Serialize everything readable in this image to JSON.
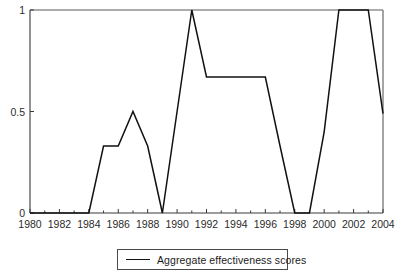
{
  "chart_data": {
    "type": "line",
    "title": "",
    "xlabel": "",
    "ylabel": "",
    "xlim": [
      1980,
      2004
    ],
    "ylim": [
      0,
      1
    ],
    "grid": false,
    "legend_position": "bottom-center",
    "x": [
      1980,
      1981,
      1982,
      1983,
      1984,
      1985,
      1986,
      1987,
      1988,
      1989,
      1990,
      1991,
      1992,
      1993,
      1994,
      1995,
      1996,
      1997,
      1998,
      1999,
      2000,
      2001,
      2002,
      2003,
      2004
    ],
    "series": [
      {
        "name": "Aggregate effectiveness scores",
        "color": "#111111",
        "values": [
          0,
          0,
          0,
          0,
          0,
          0.33,
          0.33,
          0.5,
          0.33,
          0,
          0.5,
          1,
          0.67,
          0.67,
          0.67,
          0.67,
          0.67,
          0.33,
          0,
          0,
          0.4,
          1,
          1,
          1,
          0.49
        ]
      }
    ],
    "xticks": [
      1980,
      1982,
      1984,
      1986,
      1988,
      1990,
      1992,
      1994,
      1996,
      1998,
      2000,
      2002,
      2004
    ],
    "xtick_labels": [
      "1980",
      "1982",
      "1984",
      "1986",
      "1988",
      "1990",
      "1992",
      "1994",
      "1996",
      "1998",
      "2000",
      "2002",
      "2004"
    ],
    "xticks_minor": [
      1981,
      1983,
      1985,
      1987,
      1989,
      1991,
      1993,
      1995,
      1997,
      1999,
      2001,
      2003
    ],
    "yticks": [
      0,
      0.5,
      1
    ],
    "ytick_labels": [
      "0",
      "0.5",
      "1"
    ],
    "legend": [
      {
        "label": "Aggregate effectiveness scores",
        "color": "#111111"
      }
    ],
    "axis_color": "#4a4a4a",
    "text_color": "#1a1a1a",
    "background": "#ffffff"
  }
}
